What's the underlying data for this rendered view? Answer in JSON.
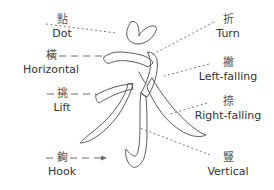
{
  "diagram": {
    "character": "永",
    "character_romanization": "yong",
    "style": "outline-skeleton",
    "stroke_color": "#5a5a5a",
    "leader_color": "#6b6b6b",
    "text_color": "#333333",
    "hanzi_color": "#555555",
    "background": "#ffffff"
  },
  "labels": [
    {
      "id": "dot",
      "side": "left",
      "hanzi": "點",
      "en": "Dot",
      "x": 14,
      "y": 14,
      "leader": {
        "type": "dotted",
        "x1": 46,
        "y1": 24,
        "x2": 116,
        "y2": 33,
        "arrow": false
      }
    },
    {
      "id": "horizontal",
      "side": "left",
      "hanzi": "橫",
      "en": "Horizontal",
      "x": 3,
      "y": 50,
      "leader": {
        "type": "dashed",
        "x1": 47,
        "y1": 56,
        "x2": 104,
        "y2": 56,
        "arrow": false
      }
    },
    {
      "id": "lift",
      "side": "left",
      "hanzi": "挑",
      "en": "Lift",
      "x": 14,
      "y": 88,
      "leader": {
        "type": "dashed",
        "x1": 47,
        "y1": 94,
        "x2": 96,
        "y2": 94,
        "arrow": false
      }
    },
    {
      "id": "hook",
      "side": "left",
      "hanzi": "鉤",
      "en": "Hook",
      "x": 14,
      "y": 152,
      "leader": {
        "type": "dashed",
        "x1": 46,
        "y1": 158,
        "x2": 106,
        "y2": 158,
        "arrow": true
      }
    },
    {
      "id": "turn",
      "side": "right",
      "hanzi": "折",
      "en": "Turn",
      "x": 180,
      "y": 14,
      "leader": {
        "type": "dotted",
        "x1": 214,
        "y1": 22,
        "x2": 146,
        "y2": 58,
        "arrow": false
      }
    },
    {
      "id": "left-falling",
      "side": "right",
      "hanzi": "撇",
      "en": "Left-falling",
      "x": 180,
      "y": 57,
      "leader": {
        "type": "dotted",
        "x1": 209,
        "y1": 64,
        "x2": 164,
        "y2": 76,
        "arrow": false
      }
    },
    {
      "id": "right-falling",
      "side": "right",
      "hanzi": "捺",
      "en": "Right-falling",
      "x": 180,
      "y": 96,
      "leader": {
        "type": "dotted",
        "x1": 207,
        "y1": 103,
        "x2": 170,
        "y2": 114,
        "arrow": false
      }
    },
    {
      "id": "vertical",
      "side": "right",
      "hanzi": "豎",
      "en": "Vertical",
      "x": 180,
      "y": 152,
      "leader": {
        "type": "dotted",
        "x1": 210,
        "y1": 155,
        "x2": 140,
        "y2": 128,
        "arrow": false
      }
    }
  ]
}
